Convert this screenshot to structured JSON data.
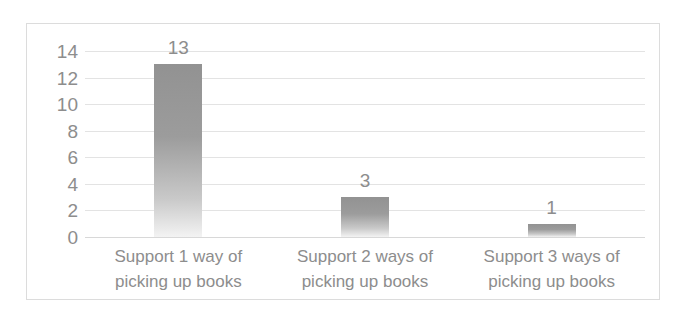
{
  "chart_data": {
    "type": "bar",
    "title": "",
    "subtitle": "",
    "xlabel": "",
    "ylabel": "",
    "categories": [
      "Support 1 way of picking up books",
      "Support 2 ways of picking up books",
      "Support 3 ways of picking up books"
    ],
    "category_lines": [
      [
        "Support 1 way of",
        "picking up books"
      ],
      [
        "Support 2 ways of",
        "picking up books"
      ],
      [
        "Support 3 ways of",
        "picking up books"
      ]
    ],
    "values": [
      13,
      3,
      1
    ],
    "data_labels": [
      "13",
      "3",
      "1"
    ],
    "ylim": [
      0,
      14
    ],
    "ytick_values": [
      14,
      12,
      10,
      8,
      6,
      4,
      2,
      0
    ],
    "ytick_labels": [
      "14",
      "12",
      "10",
      "8",
      "6",
      "4",
      "2",
      "0"
    ],
    "grid": true,
    "grid_axis": "y",
    "legend": false,
    "legend_position": "none",
    "orientation": "vertical"
  },
  "style": {
    "bar_color_top": "#929292",
    "bar_color_bottom": "#f3f3f3",
    "gridline_color": "#e3e3e3",
    "text_color": "#8d8d8d",
    "frame_color": "#dcdcdc",
    "background": "#ffffff"
  }
}
